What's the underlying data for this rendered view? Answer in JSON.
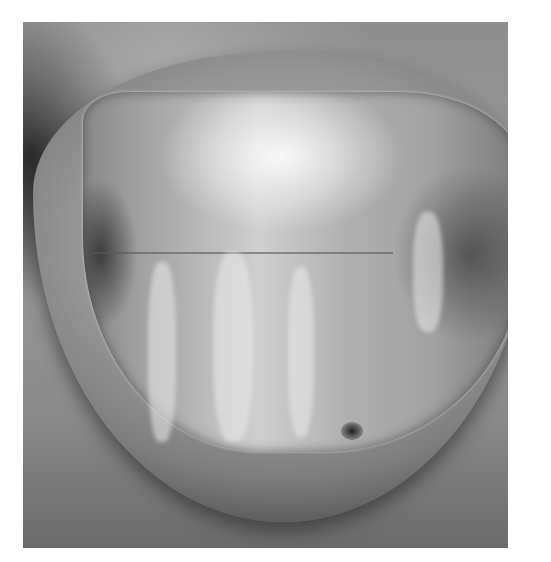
{
  "image": {
    "description": "Grayscale clinical photograph of a fingernail with dystrophic, striated nail plate",
    "colors": {
      "background": "#ffffff",
      "skin_mid": "#9a9a9a",
      "nail_highlight": "#e6e6e6",
      "shadow": "#2a2a2a"
    }
  }
}
